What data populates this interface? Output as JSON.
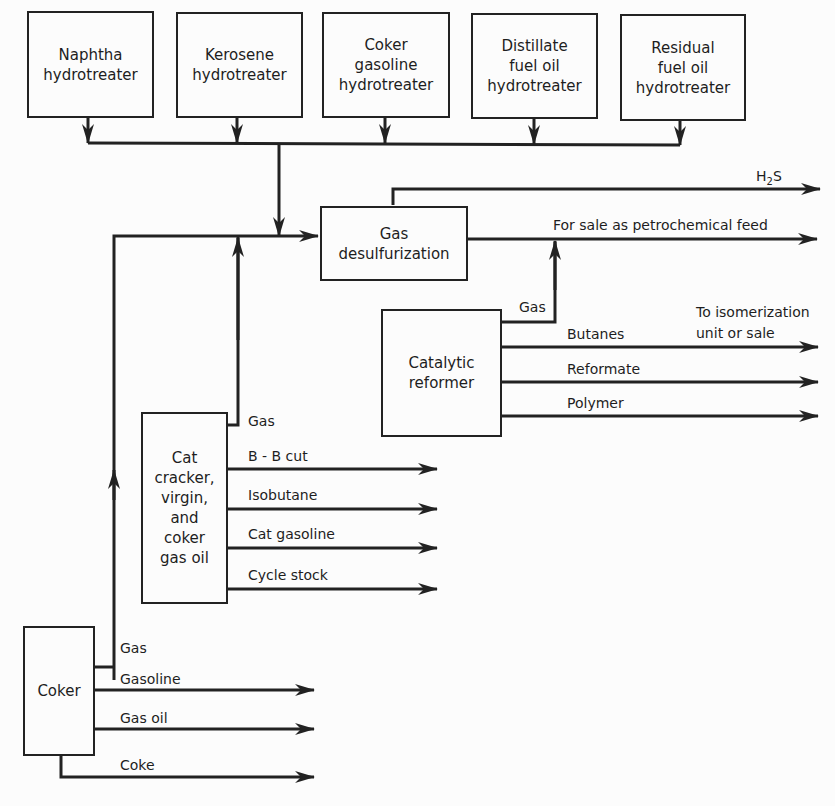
{
  "diagram": {
    "type": "process-flow",
    "units": {
      "naphtha_hydrotreater": [
        "Naphtha",
        "hydrotreater"
      ],
      "kerosene_hydrotreater": [
        "Kerosene",
        "hydrotreater"
      ],
      "coker_gasoline_hydrotreater": [
        "Coker",
        "gasoline",
        "hydrotreater"
      ],
      "distillate_hydrotreater": [
        "Distillate",
        "fuel oil",
        "hydrotreater"
      ],
      "residual_hydrotreater": [
        "Residual",
        "fuel oil",
        "hydrotreater"
      ],
      "gas_desulfurization": [
        "Gas",
        "desulfurization"
      ],
      "catalytic_reformer": [
        "Catalytic",
        "reformer"
      ],
      "cat_cracker": [
        "Cat",
        "cracker,",
        "virgin,",
        "and",
        "coker",
        "gas oil"
      ],
      "coker": [
        "Coker"
      ]
    },
    "streams": {
      "h2s": {
        "pre": "H",
        "sub": "2",
        "post": "S"
      },
      "petrochemical_feed": "For sale as petrochemical feed",
      "reformer_gas": "Gas",
      "butanes": "Butanes",
      "isomerization_note": [
        "To isomerization",
        "unit or sale"
      ],
      "reformate": "Reformate",
      "polymer": "Polymer",
      "cat_gas": "Gas",
      "bb_cut": "B - B cut",
      "isobutane": "Isobutane",
      "cat_gasoline": "Cat gasoline",
      "cycle_stock": "Cycle stock",
      "coker_gas": "Gas",
      "coker_gasoline": "Gasoline",
      "gas_oil": "Gas oil",
      "coke": "Coke"
    },
    "edges": [
      {
        "from": "Naphtha hydrotreater",
        "to": "Gas desulfurization",
        "label": ""
      },
      {
        "from": "Kerosene hydrotreater",
        "to": "Gas desulfurization",
        "label": ""
      },
      {
        "from": "Coker gasoline hydrotreater",
        "to": "Gas desulfurization",
        "label": ""
      },
      {
        "from": "Distillate fuel oil hydrotreater",
        "to": "Gas desulfurization",
        "label": ""
      },
      {
        "from": "Residual fuel oil hydrotreater",
        "to": "Gas desulfurization",
        "label": ""
      },
      {
        "from": "Coker",
        "to": "Gas desulfurization",
        "label": "Gas"
      },
      {
        "from": "Cat cracker",
        "to": "Gas desulfurization",
        "label": "Gas"
      },
      {
        "from": "Gas desulfurization",
        "to": "out",
        "label": "H2S"
      },
      {
        "from": "Gas desulfurization",
        "to": "out",
        "label": "For sale as petrochemical feed"
      },
      {
        "from": "Catalytic reformer",
        "to": "petrochemical feed line",
        "label": "Gas"
      },
      {
        "from": "Catalytic reformer",
        "to": "out",
        "label": "Butanes"
      },
      {
        "from": "Catalytic reformer",
        "to": "out",
        "label": "Reformate"
      },
      {
        "from": "Catalytic reformer",
        "to": "out",
        "label": "Polymer"
      },
      {
        "from": "Cat cracker",
        "to": "out",
        "label": "B - B cut"
      },
      {
        "from": "Cat cracker",
        "to": "out",
        "label": "Isobutane"
      },
      {
        "from": "Cat cracker",
        "to": "out",
        "label": "Cat gasoline"
      },
      {
        "from": "Cat cracker",
        "to": "out",
        "label": "Cycle stock"
      },
      {
        "from": "Coker",
        "to": "out",
        "label": "Gasoline"
      },
      {
        "from": "Coker",
        "to": "out",
        "label": "Gas oil"
      },
      {
        "from": "Coker",
        "to": "out",
        "label": "Coke"
      }
    ]
  }
}
